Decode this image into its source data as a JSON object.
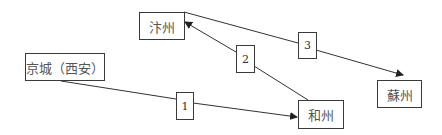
{
  "diagram": {
    "nodes": [
      {
        "id": "bianzhou",
        "label": "汴州"
      },
      {
        "id": "jingcheng",
        "label": "京城（西安）"
      },
      {
        "id": "hezhou",
        "label": "和州"
      },
      {
        "id": "suzhou",
        "label": "蘇州"
      }
    ],
    "edges": [
      {
        "label": "1",
        "from": "京城（西安）",
        "to": "和州"
      },
      {
        "label": "2",
        "from": "和州",
        "to": "汴州"
      },
      {
        "label": "3",
        "from": "汴州",
        "to": "蘇州"
      }
    ],
    "colors": {
      "line": "#333333",
      "border": "#3a3a3a",
      "text": "#555555"
    }
  }
}
